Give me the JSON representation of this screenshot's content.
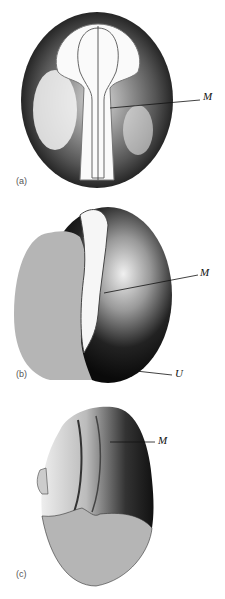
{
  "figure": {
    "panels": [
      {
        "id": "a",
        "label": "(a)",
        "annotations": [
          "M"
        ]
      },
      {
        "id": "b",
        "label": "(b)",
        "annotations": [
          "M",
          "U"
        ]
      },
      {
        "id": "c",
        "label": "(c)",
        "annotations": [
          "M"
        ]
      }
    ],
    "colors": {
      "ink": "#111111",
      "yolk": "#b5b5b5",
      "background": "#ffffff"
    }
  }
}
